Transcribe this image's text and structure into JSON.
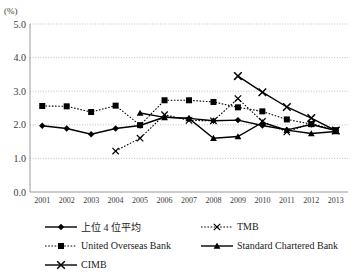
{
  "chart_data": {
    "type": "line",
    "title": "",
    "subtitle": "",
    "unit_label": "(%)",
    "xlabel": "",
    "ylabel": "",
    "x": [
      2001,
      2002,
      2003,
      2004,
      2005,
      2006,
      2007,
      2008,
      2009,
      2010,
      2011,
      2012,
      2013
    ],
    "categories": [
      "2001",
      "2002",
      "2003",
      "2004",
      "2005",
      "2006",
      "2007",
      "2008",
      "2009",
      "2010",
      "2011",
      "2012",
      "2013"
    ],
    "ylim": [
      0.0,
      5.0
    ],
    "ytick_labels": [
      "0.0",
      "1.0",
      "2.0",
      "3.0",
      "4.0",
      "5.0"
    ],
    "yticks": [
      0.0,
      1.0,
      2.0,
      3.0,
      4.0,
      5.0
    ],
    "grid": true,
    "grid_style": "dotted-horizontal",
    "legend_position": "bottom",
    "series": [
      {
        "name": "上位 4 位平均",
        "marker": "diamond",
        "line_style": "solid",
        "values": [
          1.97,
          1.89,
          1.72,
          1.89,
          1.98,
          2.23,
          2.19,
          2.12,
          2.14,
          1.98,
          1.85,
          2.01,
          1.83
        ]
      },
      {
        "name": "TMB",
        "marker": "x",
        "line_style": "dotted",
        "values": [
          null,
          null,
          null,
          1.22,
          1.6,
          2.3,
          2.13,
          2.12,
          2.78,
          2.1,
          1.79,
          2.04,
          1.83
        ]
      },
      {
        "name": "United Overseas Bank",
        "marker": "square",
        "line_style": "dotted",
        "values": [
          2.56,
          2.55,
          2.38,
          2.57,
          1.99,
          2.73,
          2.73,
          2.68,
          2.52,
          2.4,
          2.16,
          2.02,
          1.84
        ]
      },
      {
        "name": "Standard Chartered Bank",
        "marker": "triangle",
        "line_style": "solid",
        "values": [
          null,
          null,
          null,
          null,
          2.35,
          2.22,
          2.19,
          1.6,
          1.65,
          2.07,
          1.84,
          1.74,
          1.8
        ]
      },
      {
        "name": "CIMB",
        "marker": "x-solid",
        "line_style": "solid",
        "values": [
          null,
          null,
          null,
          null,
          null,
          null,
          null,
          null,
          3.45,
          2.97,
          2.53,
          2.2,
          1.83
        ]
      }
    ]
  },
  "legend": {
    "items": [
      {
        "label": "上位 4 位平均",
        "marker": "diamond",
        "line_style": "solid"
      },
      {
        "label": "TMB",
        "marker": "x",
        "line_style": "dotted"
      },
      {
        "label": "United Overseas Bank",
        "marker": "square",
        "line_style": "dotted"
      },
      {
        "label": "Standard Chartered Bank",
        "marker": "triangle",
        "line_style": "solid"
      },
      {
        "label": "CIMB",
        "marker": "x-solid",
        "line_style": "solid"
      }
    ]
  }
}
